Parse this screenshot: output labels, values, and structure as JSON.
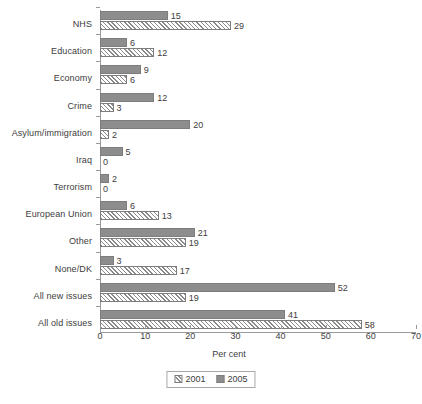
{
  "chart_data": {
    "type": "bar",
    "orientation": "horizontal",
    "title": "",
    "xlabel": "Per cent",
    "ylabel": "",
    "xlim": [
      0,
      70
    ],
    "xticks": [
      0,
      10,
      20,
      30,
      40,
      50,
      60,
      70
    ],
    "grid": false,
    "legend_position": "bottom",
    "categories": [
      "NHS",
      "Education",
      "Economy",
      "Crime",
      "Asylum/immigration",
      "Iraq",
      "Terrorism",
      "European Union",
      "Other",
      "None/DK",
      "All new issues",
      "All old issues"
    ],
    "series": [
      {
        "name": "2005",
        "values": [
          15,
          6,
          9,
          12,
          20,
          5,
          2,
          6,
          21,
          3,
          52,
          41
        ]
      },
      {
        "name": "2001",
        "values": [
          29,
          12,
          6,
          3,
          2,
          0,
          0,
          13,
          19,
          17,
          19,
          58
        ]
      }
    ],
    "colors": {
      "series_2005_fill": "#8d8d8d",
      "series_2001_fill": "#ffffff",
      "bar_border": "#7d7d7d",
      "axis": "#9a9a9a",
      "text": "#3d3d3d"
    }
  },
  "legend": {
    "entries": [
      {
        "label": "2001",
        "style": "hatched"
      },
      {
        "label": "2005",
        "style": "solid-gray"
      }
    ]
  },
  "axis": {
    "x_title": "Per cent",
    "tick_labels": [
      "0",
      "10",
      "20",
      "30",
      "40",
      "50",
      "60",
      "70"
    ]
  }
}
